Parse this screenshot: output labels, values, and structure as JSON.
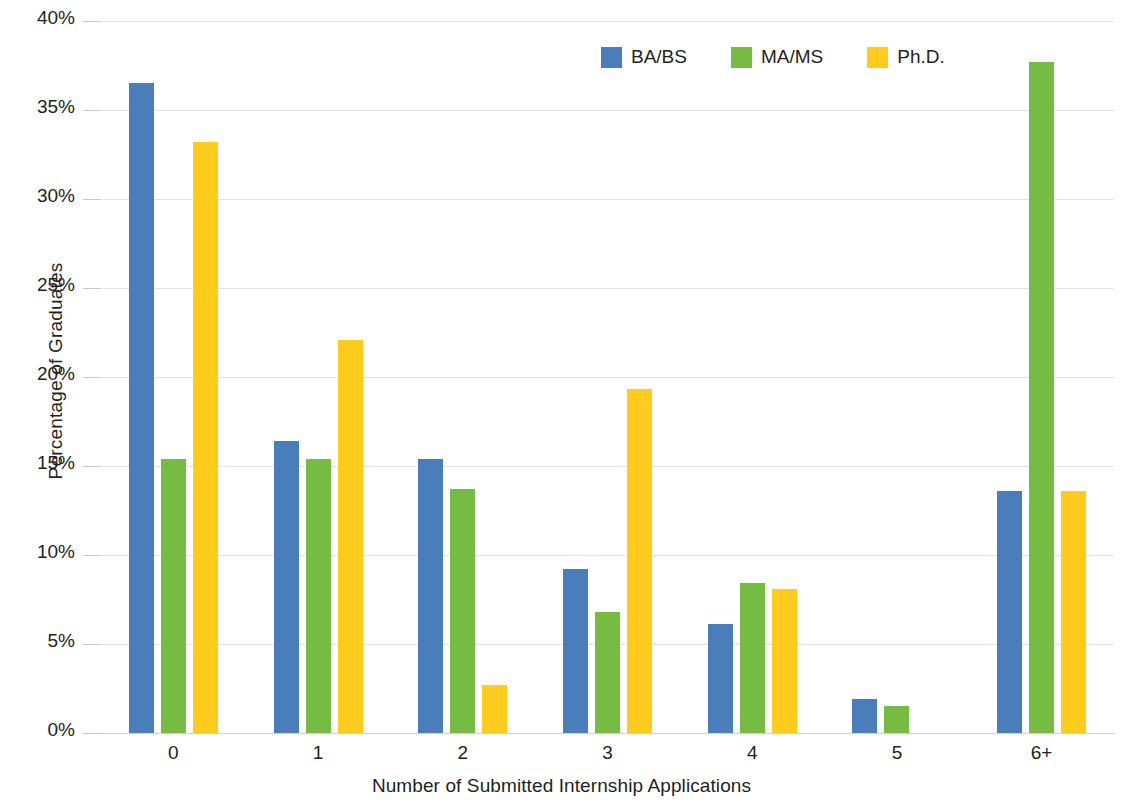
{
  "chart_data": {
    "type": "bar",
    "title": "",
    "subtitle": "",
    "xlabel": "Number of Submitted Internship Applications",
    "ylabel": "Percentage of Graduates",
    "categories": [
      "0",
      "1",
      "2",
      "3",
      "4",
      "5",
      "6+"
    ],
    "series": [
      {
        "name": "BA/BS",
        "color": "#4a7ebb",
        "values": [
          36.5,
          16.4,
          15.4,
          9.2,
          6.1,
          1.9,
          13.6
        ]
      },
      {
        "name": "MA/MS",
        "color": "#77bc42",
        "values": [
          15.4,
          15.4,
          13.7,
          6.8,
          8.4,
          1.5,
          37.7
        ]
      },
      {
        "name": "Ph.D.",
        "color": "#ffcc1d",
        "values": [
          33.2,
          22.1,
          2.7,
          19.3,
          8.1,
          0.0,
          13.6
        ]
      }
    ],
    "ylim": [
      0,
      40
    ],
    "ytick_values": [
      0,
      5,
      10,
      15,
      20,
      25,
      30,
      35,
      40
    ],
    "ytick_labels": [
      "0%",
      "5%",
      "10%",
      "15%",
      "20%",
      "25%",
      "30%",
      "35%",
      "40%"
    ],
    "grid": true,
    "grid_axis": "y",
    "grid_color": "#e3e3e3",
    "legend_position": "top-right",
    "background_color": "#ffffff",
    "bar_group_mode": "grouped"
  }
}
